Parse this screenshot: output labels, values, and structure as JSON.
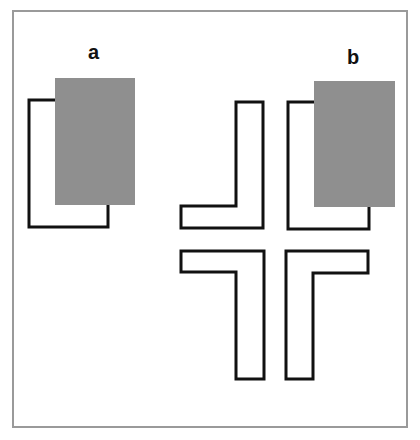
{
  "figure": {
    "frame_color": "#9a9a9a",
    "stroke_color": "#111111",
    "occluder_color": "#8f8f8f",
    "labels": {
      "a": "a",
      "b": "b"
    },
    "panel_a": {
      "outline_bracket": {
        "x1": 29,
        "y1": 100,
        "x2": 108,
        "y2": 227
      },
      "occluder": {
        "x": 55,
        "y": 78,
        "w": 80,
        "h": 127
      }
    },
    "panel_b": {
      "outline_bracket": {
        "x1": 288,
        "y1": 102,
        "x2": 369,
        "y2": 229
      },
      "occluder": {
        "x": 314,
        "y": 81,
        "w": 81,
        "h": 126
      },
      "corner_shapes": [
        "top-left-L",
        "bottom-left-L",
        "bottom-right-L"
      ]
    }
  }
}
